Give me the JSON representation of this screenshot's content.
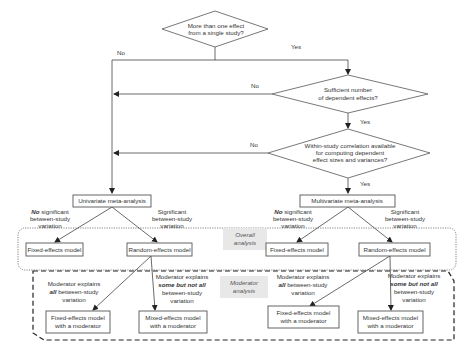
{
  "diagram": {
    "decisions": [
      {
        "id": "d1",
        "lines": [
          "More than one effect",
          "from a single study?"
        ]
      },
      {
        "id": "d2",
        "lines": [
          "Sufficient number",
          "of dependent effects?"
        ]
      },
      {
        "id": "d3",
        "lines": [
          "Within-study correlation available",
          "for computing dependent",
          "effect sizes and variances?"
        ]
      }
    ],
    "edge_labels": {
      "d1_no": "No",
      "d1_yes": "Yes",
      "d2_no": "No",
      "d2_yes": "Yes",
      "d3_no": "No",
      "d3_yes": "Yes"
    },
    "nodes": {
      "univariate": "Univariate meta-analysis",
      "multivariate": "Multivariate meta-analysis",
      "fixed_left": "Fixed-effects model",
      "random_left": "Random-effects model",
      "fixed_right": "Fixed-effects model",
      "random_right": "Random-effects model",
      "fixed_mod_left": [
        "Fixed-effects model",
        "with a moderator"
      ],
      "mixed_mod_left": [
        "Mixed-effects model",
        "with a moderator"
      ],
      "fixed_mod_right": [
        "Fixed-effects model",
        "with a moderator"
      ],
      "mixed_mod_right": [
        "Mixed-effects model",
        "with a moderator"
      ]
    },
    "branch_labels": {
      "no_sig": {
        "bold": "No",
        "rest": " significant",
        "line2": "between-study",
        "line3": "variation"
      },
      "sig": {
        "line1": "Significant",
        "line2": "between-study",
        "line3": "variation"
      },
      "mod_all": {
        "line1": "Moderator explains",
        "bold": "all",
        "rest": " between-study",
        "line3": "variation"
      },
      "mod_some": {
        "line1": "Moderator explains",
        "bold": "some but not all",
        "line3": "between-study",
        "line4": "variation"
      }
    },
    "regions": {
      "overall": [
        "Overall",
        "analysis"
      ],
      "moderator": [
        "Moderator",
        "analysis"
      ]
    }
  }
}
